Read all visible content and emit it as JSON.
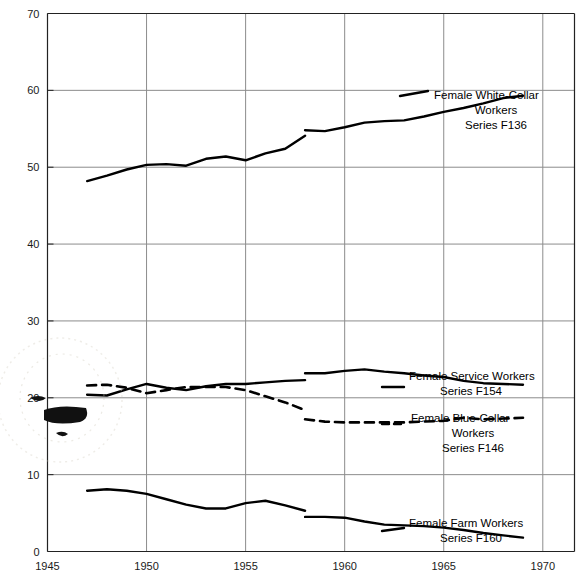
{
  "chart_data": {
    "type": "line",
    "title": "",
    "xlabel": "",
    "ylabel": "",
    "xlim": [
      1945,
      1971.6
    ],
    "ylim": [
      0,
      70
    ],
    "xticks": [
      1945,
      1950,
      1955,
      1960,
      1965,
      1970
    ],
    "xtick_labels": [
      "1945",
      "1950",
      "1955",
      "1960",
      "1965",
      "1970"
    ],
    "yticks": [
      0,
      10,
      20,
      30,
      40,
      50,
      60,
      70
    ],
    "ytick_labels": [
      "0",
      "10",
      "20",
      "30",
      "40",
      "50",
      "60",
      "70"
    ],
    "grid": true,
    "grid_axis": "both",
    "legend_position": "right-inline",
    "series": [
      {
        "name": "Female White-Collar Workers",
        "code": "Series F136",
        "label_lines": [
          "Female White-Collar",
          "Workers",
          "Series F136"
        ],
        "style": "solid",
        "color": "#000000",
        "segments": [
          {
            "x": [
              1947,
              1948,
              1949,
              1950,
              1951,
              1952,
              1953,
              1954,
              1955,
              1956,
              1957,
              1958
            ],
            "y": [
              48.2,
              48.9,
              49.7,
              50.3,
              50.4,
              50.2,
              51.1,
              51.4,
              50.9,
              51.8,
              52.4,
              54.1
            ]
          },
          {
            "x": [
              1958,
              1959,
              1960,
              1961,
              1962,
              1963,
              1964,
              1965,
              1966,
              1967,
              1968,
              1969
            ],
            "y": [
              54.8,
              54.7,
              55.2,
              55.8,
              56.0,
              56.1,
              56.6,
              57.2,
              57.7,
              58.3,
              59.0,
              59.3
            ]
          }
        ]
      },
      {
        "name": "Female Service Workers",
        "code": "Series F154",
        "label_lines": [
          "Female Service Workers",
          "Series F154"
        ],
        "style": "solid",
        "color": "#000000",
        "segments": [
          {
            "x": [
              1947,
              1948,
              1949,
              1950,
              1951,
              1952,
              1953,
              1954,
              1955,
              1956,
              1957,
              1958
            ],
            "y": [
              20.4,
              20.3,
              21.1,
              21.8,
              21.3,
              21.0,
              21.5,
              21.8,
              21.8,
              22.0,
              22.2,
              22.3
            ]
          },
          {
            "x": [
              1958,
              1959,
              1960,
              1961,
              1962,
              1963,
              1964,
              1965,
              1966,
              1967,
              1968,
              1969
            ],
            "y": [
              23.2,
              23.2,
              23.5,
              23.7,
              23.4,
              23.2,
              22.9,
              22.7,
              22.2,
              21.9,
              21.8,
              21.7
            ]
          }
        ]
      },
      {
        "name": "Female Blue-Collar Workers",
        "code": "Series F146",
        "label_lines": [
          "Female Blue-Collar",
          "Workers",
          "Series F146"
        ],
        "style": "dashed",
        "color": "#000000",
        "segments": [
          {
            "x": [
              1947,
              1948,
              1949,
              1950,
              1951,
              1952,
              1953,
              1954,
              1955,
              1956,
              1957,
              1958
            ],
            "y": [
              21.6,
              21.7,
              21.3,
              20.6,
              21.0,
              21.4,
              21.4,
              21.4,
              21.0,
              20.2,
              19.4,
              18.4
            ]
          },
          {
            "x": [
              1958,
              1959,
              1960,
              1961,
              1962,
              1963,
              1964,
              1965,
              1966,
              1967,
              1968,
              1969
            ],
            "y": [
              17.2,
              16.9,
              16.8,
              16.8,
              16.8,
              16.8,
              16.9,
              17.0,
              17.4,
              17.2,
              17.3,
              17.4
            ]
          }
        ]
      },
      {
        "name": "Female Farm Workers",
        "code": "Series F160",
        "label_lines": [
          "Female Farm Workers",
          "Series F160"
        ],
        "style": "solid",
        "color": "#000000",
        "segments": [
          {
            "x": [
              1947,
              1948,
              1949,
              1950,
              1951,
              1952,
              1953,
              1954,
              1955,
              1956,
              1957,
              1958
            ],
            "y": [
              7.9,
              8.1,
              7.9,
              7.5,
              6.8,
              6.1,
              5.6,
              5.6,
              6.3,
              6.6,
              6.0,
              5.3
            ]
          },
          {
            "x": [
              1958,
              1959,
              1960,
              1961,
              1962,
              1963,
              1964,
              1965,
              1966,
              1967,
              1968,
              1969
            ],
            "y": [
              4.5,
              4.5,
              4.4,
              3.9,
              3.5,
              3.4,
              3.3,
              3.1,
              2.8,
              2.4,
              2.1,
              1.8
            ]
          }
        ]
      }
    ]
  },
  "axes": {
    "x_axis_name": "year-axis",
    "y_axis_name": "percent-axis"
  }
}
